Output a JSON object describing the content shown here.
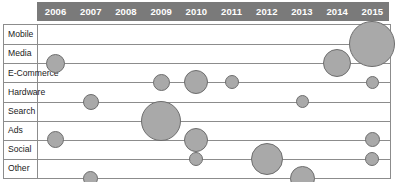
{
  "chart_data": {
    "type": "scatter",
    "title": "",
    "xlabel": "",
    "ylabel": "",
    "grid": true,
    "legend_position": "none",
    "categories": [
      "2006",
      "2007",
      "2008",
      "2009",
      "2010",
      "2011",
      "2012",
      "2013",
      "2014",
      "2015"
    ],
    "rows": [
      "Mobile",
      "Media",
      "E-Commerce",
      "Hardware",
      "Search",
      "Ads",
      "Social",
      "Other"
    ],
    "bubble_color": "#a9a9a9",
    "bubble_border_color": "#6e6e6e",
    "header_color": "#7a7a7a",
    "header_text_color": "#ffffff",
    "frame_color": "#8c8c8c",
    "points": [
      {
        "row": "Mobile",
        "year": "2015",
        "size": 46
      },
      {
        "row": "Media",
        "year": "2006",
        "size": 19
      },
      {
        "row": "Media",
        "year": "2014",
        "size": 28
      },
      {
        "row": "E-Commerce",
        "year": "2009",
        "size": 17
      },
      {
        "row": "E-Commerce",
        "year": "2010",
        "size": 24
      },
      {
        "row": "E-Commerce",
        "year": "2011",
        "size": 14
      },
      {
        "row": "E-Commerce",
        "year": "2015",
        "size": 13
      },
      {
        "row": "Hardware",
        "year": "2007",
        "size": 16
      },
      {
        "row": "Hardware",
        "year": "2013",
        "size": 13
      },
      {
        "row": "Search",
        "year": "2009",
        "size": 40
      },
      {
        "row": "Ads",
        "year": "2006",
        "size": 17
      },
      {
        "row": "Ads",
        "year": "2010",
        "size": 24
      },
      {
        "row": "Ads",
        "year": "2015",
        "size": 15
      },
      {
        "row": "Social",
        "year": "2010",
        "size": 14
      },
      {
        "row": "Social",
        "year": "2012",
        "size": 32
      },
      {
        "row": "Social",
        "year": "2015",
        "size": 14
      },
      {
        "row": "Other",
        "year": "2007",
        "size": 15
      },
      {
        "row": "Other",
        "year": "2013",
        "size": 25
      }
    ]
  },
  "header": {
    "years": [
      "2006",
      "2007",
      "2008",
      "2009",
      "2010",
      "2011",
      "2012",
      "2013",
      "2014",
      "2015"
    ]
  },
  "rows": {
    "labels": [
      "Mobile",
      "Media",
      "E-Commerce",
      "Hardware",
      "Search",
      "Ads",
      "Social",
      "Other"
    ]
  }
}
